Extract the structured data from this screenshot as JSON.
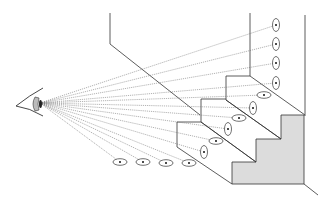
{
  "diagram": {
    "title": "",
    "colors": {
      "line": "#333333",
      "sight_line": "#666666",
      "side_face_fill": "#dcdcdc",
      "background": "#ffffff"
    },
    "eye": {
      "x": 38,
      "y": 103
    },
    "wall_markers": [
      {
        "x": 276,
        "y": 25
      },
      {
        "x": 276,
        "y": 44
      },
      {
        "x": 276,
        "y": 63
      },
      {
        "x": 276,
        "y": 83
      }
    ],
    "tread_markers": [
      {
        "x": 264,
        "y": 95
      },
      {
        "x": 239,
        "y": 118
      },
      {
        "x": 216,
        "y": 141
      }
    ],
    "riser_markers": [
      {
        "x": 253,
        "y": 108
      },
      {
        "x": 228,
        "y": 129
      },
      {
        "x": 204,
        "y": 152
      }
    ],
    "floor_markers": [
      {
        "x": 120,
        "y": 162
      },
      {
        "x": 143,
        "y": 162
      },
      {
        "x": 166,
        "y": 163
      },
      {
        "x": 189,
        "y": 163
      }
    ]
  }
}
